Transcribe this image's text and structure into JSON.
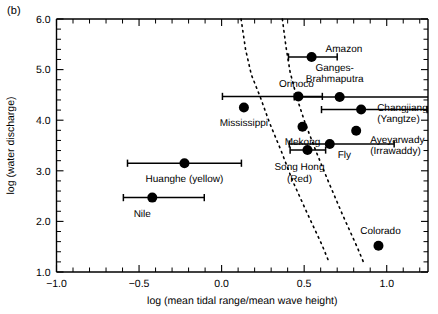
{
  "panel": {
    "label": "(b)"
  },
  "chart_data": {
    "type": "scatter",
    "title": "",
    "xlabel": "log (mean tidal range/mean wave height)",
    "ylabel": "log (water discharge)",
    "xlim": [
      -1.0,
      1.25
    ],
    "ylim": [
      1.0,
      6.0
    ],
    "xticks": [
      -1.0,
      -0.5,
      0.0,
      0.5,
      1.0
    ],
    "xticklabels": [
      "−1.0",
      "−0.5",
      "0.0",
      "0.5",
      "1.0"
    ],
    "yticks": [
      1.0,
      2.0,
      3.0,
      4.0,
      5.0,
      6.0
    ],
    "yticklabels": [
      "1.0",
      "2.0",
      "3.0",
      "4.0",
      "5.0",
      "6.0"
    ],
    "x_minor_interval": 0.1,
    "y_minor_interval": 0.2,
    "grid": false,
    "legend": "none",
    "points": [
      {
        "name": "Amazon",
        "label": "Amazon",
        "x": 0.545,
        "y": 5.25,
        "xerr_low": 0.405,
        "xerr_high": 0.7,
        "label_dx": 14,
        "label_dy": -5,
        "label_anchor": "start",
        "label_lines": [
          "Amazon"
        ]
      },
      {
        "name": "Ganges-Brahmaputra",
        "label": "Ganges-Brahmaputra",
        "x": 0.715,
        "y": 4.46,
        "xerr_low": 0.44,
        "xerr_high": 1.285,
        "label_dx": -5,
        "label_dy": -26,
        "label_anchor": "middle",
        "label_lines": [
          "Ganges-",
          "Brahmaputra"
        ]
      },
      {
        "name": "Orinoco",
        "label": "Orinoco",
        "x": 0.465,
        "y": 4.47,
        "xerr_low": 0.005,
        "xerr_high": 0.61,
        "label_dx": -2,
        "label_dy": -9,
        "label_anchor": "middle",
        "label_lines": [
          "Orinoco"
        ]
      },
      {
        "name": "Changjiang",
        "label": "Changjiang (Yangtze)",
        "x": 0.845,
        "y": 4.21,
        "xerr_low": 0.605,
        "xerr_high": 1.245,
        "label_dx": 16,
        "label_dy": 1,
        "label_anchor": "start",
        "label_lines": [
          "Changjiang",
          "(Yangtze)"
        ]
      },
      {
        "name": "Mississippi",
        "label": "Mississippi",
        "x": 0.135,
        "y": 4.25,
        "xerr_low": null,
        "xerr_high": null,
        "label_dx": 0,
        "label_dy": 18,
        "label_anchor": "middle",
        "label_lines": [
          "Mississippi"
        ]
      },
      {
        "name": "Mekong",
        "label": "Mekong",
        "x": 0.49,
        "y": 3.87,
        "xerr_low": null,
        "xerr_high": null,
        "label_dx": 0,
        "label_dy": 18,
        "label_anchor": "middle",
        "label_lines": [
          "Mekong"
        ]
      },
      {
        "name": "Ayeyarwady",
        "label": "Ayeyarwady (Irrawaddy)",
        "x": 0.815,
        "y": 3.79,
        "xerr_low": null,
        "xerr_high": null,
        "label_dx": 14,
        "label_dy": 12,
        "label_anchor": "start",
        "label_lines": [
          "Ayeyarwady",
          "(Irrawaddy)"
        ]
      },
      {
        "name": "Fly",
        "label": "Fly",
        "x": 0.655,
        "y": 3.53,
        "xerr_low": 0.41,
        "xerr_high": 1.045,
        "label_dx": 8,
        "label_dy": 14,
        "label_anchor": "start",
        "label_lines": [
          "Fly"
        ]
      },
      {
        "name": "Song Hong",
        "label": "Song Hong (Red)",
        "x": 0.52,
        "y": 3.41,
        "xerr_low": 0.415,
        "xerr_high": 0.63,
        "label_dx": -8,
        "label_dy": 20,
        "label_anchor": "middle",
        "label_lines": [
          "Song Hong",
          "(Red)"
        ]
      },
      {
        "name": "Huanghe",
        "label": "Huanghe (yellow)",
        "x": -0.225,
        "y": 3.15,
        "xerr_low": -0.57,
        "xerr_high": 0.12,
        "label_dx": 0,
        "label_dy": 19,
        "label_anchor": "middle",
        "label_lines": [
          "Huanghe (yellow)"
        ]
      },
      {
        "name": "Nile",
        "label": "Nile",
        "x": -0.42,
        "y": 2.47,
        "xerr_low": -0.595,
        "xerr_high": -0.105,
        "label_dx": -10,
        "label_dy": 19,
        "label_anchor": "middle",
        "label_lines": [
          "Nile"
        ]
      },
      {
        "name": "Colorado",
        "label": "Colorado",
        "x": 0.95,
        "y": 1.52,
        "xerr_low": null,
        "xerr_high": null,
        "label_dx": 2,
        "label_dy": -12,
        "label_anchor": "middle",
        "label_lines": [
          "Colorado"
        ]
      }
    ],
    "dashed_curves": [
      {
        "name": "left-boundary",
        "points": [
          [
            0.118,
            6.0
          ],
          [
            0.145,
            5.4
          ],
          [
            0.18,
            4.9
          ],
          [
            0.235,
            4.45
          ],
          [
            0.29,
            3.95
          ],
          [
            0.36,
            3.4
          ],
          [
            0.43,
            2.8
          ],
          [
            0.52,
            2.15
          ],
          [
            0.61,
            1.52
          ],
          [
            0.65,
            1.2
          ]
        ]
      },
      {
        "name": "right-boundary",
        "points": [
          [
            0.368,
            6.0
          ],
          [
            0.39,
            5.45
          ],
          [
            0.415,
            4.95
          ],
          [
            0.455,
            4.45
          ],
          [
            0.505,
            3.95
          ],
          [
            0.57,
            3.4
          ],
          [
            0.645,
            2.8
          ],
          [
            0.73,
            2.15
          ],
          [
            0.82,
            1.5
          ],
          [
            0.865,
            1.15
          ]
        ]
      }
    ]
  }
}
